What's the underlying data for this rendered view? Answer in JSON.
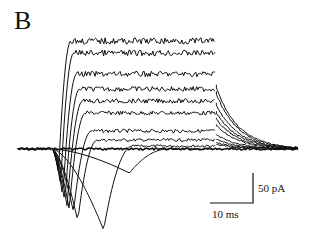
{
  "figure": {
    "panel_label": "B",
    "scale_bar": {
      "y_label": "50 pA",
      "x_label": "10 ms"
    }
  },
  "chart_data": {
    "type": "line",
    "title": "",
    "panel": "B",
    "xlabel": "time",
    "ylabel": "current",
    "scale_bars": {
      "x": {
        "value": 10,
        "unit": "ms"
      },
      "y": {
        "value": 50,
        "unit": "pA"
      }
    },
    "grid": false,
    "legend": null,
    "step_on_ms": 0,
    "step_off_ms": 38,
    "traces": [
      {
        "name": "trace 1",
        "inward_peak_pA": -40,
        "inward_peak_time_ms": 18,
        "steady_outward_pA": 0
      },
      {
        "name": "trace 2",
        "inward_peak_pA": -135,
        "inward_peak_time_ms": 12,
        "steady_outward_pA": 5
      },
      {
        "name": "trace 3",
        "inward_peak_pA": -120,
        "inward_peak_time_ms": 6,
        "steady_outward_pA": 15
      },
      {
        "name": "trace 4",
        "inward_peak_pA": -105,
        "inward_peak_time_ms": 5,
        "steady_outward_pA": 30
      },
      {
        "name": "trace 5",
        "inward_peak_pA": -100,
        "inward_peak_time_ms": 4,
        "steady_outward_pA": 60
      },
      {
        "name": "trace 6",
        "inward_peak_pA": -95,
        "inward_peak_time_ms": 3.5,
        "steady_outward_pA": 80
      },
      {
        "name": "trace 7",
        "inward_peak_pA": -90,
        "inward_peak_time_ms": 3,
        "steady_outward_pA": 100
      },
      {
        "name": "trace 8",
        "inward_peak_pA": -80,
        "inward_peak_time_ms": 2.5,
        "steady_outward_pA": 125
      },
      {
        "name": "trace 9",
        "inward_peak_pA": -60,
        "inward_peak_time_ms": 2,
        "steady_outward_pA": 160
      },
      {
        "name": "trace 10",
        "inward_peak_pA": -40,
        "inward_peak_time_ms": 1.5,
        "steady_outward_pA": 180
      }
    ]
  }
}
